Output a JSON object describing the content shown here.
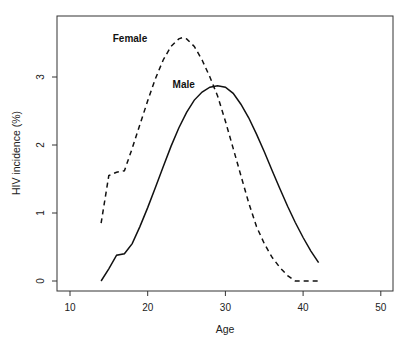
{
  "chart_data": {
    "type": "line",
    "title": "",
    "xlabel": "Age",
    "ylabel": "HIV incidence (%)",
    "xlim": [
      8.3,
      51.7
    ],
    "ylim": [
      -0.15,
      3.85
    ],
    "xticks": [
      10,
      20,
      30,
      40,
      50
    ],
    "yticks": [
      0,
      1,
      2,
      3
    ],
    "grid": false,
    "legend": "inline labels",
    "series": [
      {
        "name": "Female",
        "style": "dashed",
        "label_pos": [
          15.5,
          3.52
        ],
        "points": [
          [
            14,
            0.85
          ],
          [
            15,
            1.55
          ],
          [
            16,
            1.6
          ],
          [
            17,
            1.62
          ],
          [
            18,
            1.95
          ],
          [
            19,
            2.3
          ],
          [
            20,
            2.65
          ],
          [
            21,
            2.98
          ],
          [
            22,
            3.25
          ],
          [
            23,
            3.45
          ],
          [
            24,
            3.56
          ],
          [
            24.5,
            3.58
          ],
          [
            25,
            3.56
          ],
          [
            26,
            3.45
          ],
          [
            27,
            3.25
          ],
          [
            28,
            3.0
          ],
          [
            29,
            2.72
          ],
          [
            30,
            2.35
          ],
          [
            31,
            1.95
          ],
          [
            32,
            1.55
          ],
          [
            33,
            1.15
          ],
          [
            34,
            0.8
          ],
          [
            35,
            0.55
          ],
          [
            36,
            0.35
          ],
          [
            37,
            0.2
          ],
          [
            38,
            0.08
          ],
          [
            39,
            0.0
          ],
          [
            40,
            0.0
          ],
          [
            41,
            0.0
          ],
          [
            42,
            0.0
          ]
        ]
      },
      {
        "name": "Male",
        "style": "solid",
        "label_pos": [
          23.2,
          2.84
        ],
        "points": [
          [
            14,
            0.0
          ],
          [
            15,
            0.18
          ],
          [
            16,
            0.38
          ],
          [
            17,
            0.4
          ],
          [
            18,
            0.55
          ],
          [
            19,
            0.8
          ],
          [
            20,
            1.08
          ],
          [
            21,
            1.38
          ],
          [
            22,
            1.68
          ],
          [
            23,
            1.98
          ],
          [
            24,
            2.25
          ],
          [
            25,
            2.48
          ],
          [
            26,
            2.66
          ],
          [
            27,
            2.78
          ],
          [
            28,
            2.85
          ],
          [
            29,
            2.87
          ],
          [
            30,
            2.85
          ],
          [
            31,
            2.76
          ],
          [
            32,
            2.6
          ],
          [
            33,
            2.4
          ],
          [
            34,
            2.16
          ],
          [
            35,
            1.9
          ],
          [
            36,
            1.63
          ],
          [
            37,
            1.36
          ],
          [
            38,
            1.1
          ],
          [
            39,
            0.86
          ],
          [
            40,
            0.64
          ],
          [
            41,
            0.44
          ],
          [
            42,
            0.27
          ]
        ]
      }
    ]
  }
}
